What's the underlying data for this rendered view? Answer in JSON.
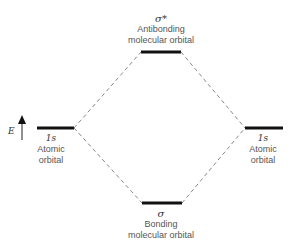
{
  "diagram": {
    "axis": {
      "label": "E"
    },
    "antibonding": {
      "symbol": "σ*",
      "line1": "Antibonding",
      "line2": "molecular orbital"
    },
    "bonding": {
      "symbol": "σ",
      "line1": "Bonding",
      "line2": "molecular orbital"
    },
    "left_atomic": {
      "symbol": "1s",
      "line1": "Atomic",
      "line2": "orbital"
    },
    "right_atomic": {
      "symbol": "1s",
      "line1": "Atomic",
      "line2": "orbital"
    },
    "colors": {
      "level": "#111111",
      "dash": "#888888",
      "text": "#555555"
    }
  }
}
